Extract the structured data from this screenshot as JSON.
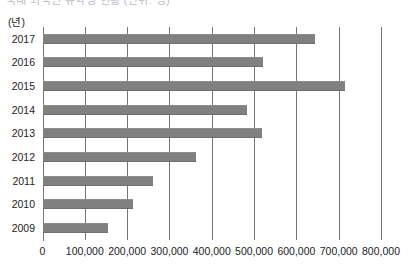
{
  "title_sliver": "국내 외국인 유학생 현황 (단위: 명)",
  "axis_unit_label": "(년)",
  "chart_data": {
    "type": "bar",
    "orientation": "horizontal",
    "title": "",
    "xlabel": "",
    "ylabel": "(년)",
    "categories": [
      "2017",
      "2016",
      "2015",
      "2014",
      "2013",
      "2012",
      "2011",
      "2010",
      "2009"
    ],
    "values": [
      645000,
      520000,
      715000,
      483000,
      518000,
      362000,
      260000,
      215000,
      155000
    ],
    "xlim": [
      0,
      800000
    ],
    "xticks": [
      0,
      100000,
      200000,
      300000,
      400000,
      500000,
      600000,
      700000,
      800000
    ],
    "xtick_labels": [
      "0",
      "100,000",
      "200,000",
      "300,000",
      "400,000",
      "500,000",
      "600,000",
      "700,000",
      "800,000"
    ],
    "grid": true,
    "grid_axis": "x",
    "legend": null,
    "bar_color": "#808080",
    "grid_color": "#767676",
    "background_color": "#ffffff"
  }
}
